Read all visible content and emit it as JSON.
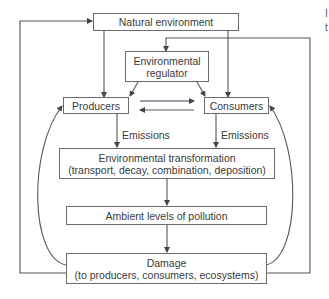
{
  "diagram": {
    "nodes": {
      "natural_environment": {
        "label": "Natural environment"
      },
      "environmental_regulator": {
        "line1": "Environmental",
        "line2": "regulator"
      },
      "producers": {
        "label": "Producers"
      },
      "consumers": {
        "label": "Consumers"
      },
      "environmental_transformation": {
        "line1": "Environmental transformation",
        "line2": "(transport, decay, combination, deposition)"
      },
      "ambient_levels": {
        "label": "Ambient levels of pollution"
      },
      "damage": {
        "line1": "Damage",
        "line2": "(to producers, consumers, ecosystems)"
      }
    },
    "edge_labels": {
      "producers_emissions": "Emissions",
      "consumers_emissions": "Emissions"
    },
    "edges": [
      {
        "from": "natural_environment",
        "to": "producers"
      },
      {
        "from": "natural_environment",
        "to": "consumers"
      },
      {
        "from": "environmental_regulator",
        "to": "producers"
      },
      {
        "from": "environmental_regulator",
        "to": "consumers"
      },
      {
        "from": "producers",
        "to": "consumers"
      },
      {
        "from": "consumers",
        "to": "producers"
      },
      {
        "from": "producers",
        "to": "environmental_transformation",
        "label": "Emissions"
      },
      {
        "from": "consumers",
        "to": "environmental_transformation",
        "label": "Emissions"
      },
      {
        "from": "environmental_transformation",
        "to": "ambient_levels"
      },
      {
        "from": "ambient_levels",
        "to": "damage"
      },
      {
        "from": "damage",
        "to": "producers"
      },
      {
        "from": "damage",
        "to": "consumers"
      },
      {
        "from": "damage",
        "to": "natural_environment"
      },
      {
        "from": "damage",
        "to": "environmental_regulator"
      }
    ],
    "margin_fragments": [
      "I",
      "t"
    ]
  }
}
